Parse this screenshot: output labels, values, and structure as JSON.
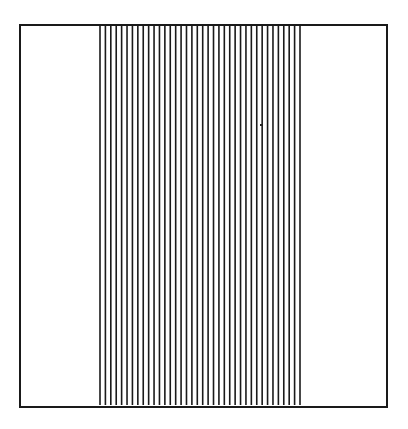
{
  "diagram": {
    "type": "vertical-line-grating",
    "frame": {
      "x": 19,
      "y": 24,
      "width": 367,
      "height": 382,
      "stroke": "#1a1a1a",
      "stroke_width": 2
    },
    "lines": {
      "count": 38,
      "x_start": 100,
      "x_end": 300,
      "y_top": 25,
      "y_bottom": 405,
      "stroke": "#1a1a1a",
      "stroke_width": 1.6
    },
    "artifact": {
      "x": 260,
      "y": 124
    }
  }
}
